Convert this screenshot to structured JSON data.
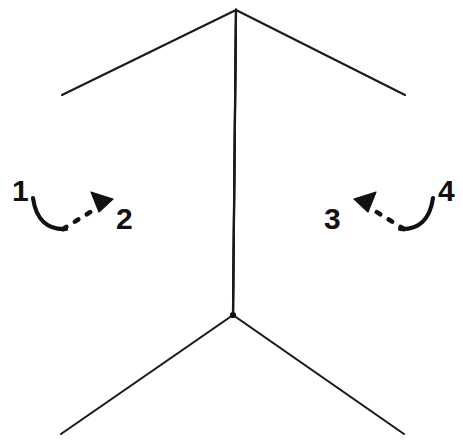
{
  "figure": {
    "title": "Folded planar surface with numbered side callouts",
    "background_color": "#ffffff",
    "line_color": "#1a1a1a",
    "annotation_color": "#111111",
    "canvas": {
      "width": 463,
      "height": 444
    }
  },
  "geometry": {
    "apex_top": {
      "x": 236,
      "y": 10
    },
    "crease_bottom": {
      "x": 233,
      "y": 315
    },
    "left_panel": {
      "top_outer": {
        "x": 62,
        "y": 95
      },
      "bottom_outer": {
        "x": 61,
        "y": 434
      },
      "outline": "62,95 236,10 233,315 61,434"
    },
    "right_panel": {
      "top_outer": {
        "x": 405,
        "y": 95
      },
      "bottom_outer": {
        "x": 404,
        "y": 434
      },
      "outline": "405,95 236,10 233,315 404,434"
    }
  },
  "callouts": [
    {
      "id": "callout-1",
      "label": "1",
      "label_x": 12,
      "label_y": 201,
      "kind": "arc-hook",
      "side": "left",
      "arc_path": "M 33 198 C 36 220 48 230 66 229",
      "description": "curved hook leader wrapping the left outer edge"
    },
    {
      "id": "callout-2",
      "label": "2",
      "label_x": 116,
      "label_y": 229,
      "kind": "dashed-arrow",
      "side": "left",
      "dash_path": "M 63 229 L 92 211",
      "arrow_points": "91,192 113,199 99,212",
      "arrow_direction": "up-left",
      "description": "dashed leader with solid triangular arrowhead pointing up-left"
    },
    {
      "id": "callout-3",
      "label": "3",
      "label_x": 324,
      "label_y": 229,
      "kind": "dashed-arrow",
      "side": "right",
      "dash_path": "M 404 229 L 375 211",
      "arrow_points": "376,192 354,199 368,212",
      "arrow_direction": "up-right",
      "description": "dashed leader with solid triangular arrowhead pointing up-right"
    },
    {
      "id": "callout-4",
      "label": "4",
      "label_x": 438,
      "label_y": 201,
      "kind": "arc-hook",
      "side": "right",
      "arc_path": "M 433 198 C 430 220 418 230 400 229",
      "description": "curved hook leader wrapping the right outer edge"
    }
  ]
}
